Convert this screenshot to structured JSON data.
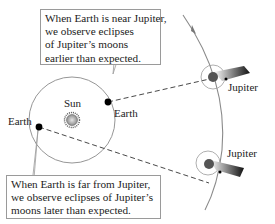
{
  "diagram": {
    "callouts": {
      "near": {
        "lines": [
          "When Earth is near Jupiter,",
          "we observe eclipses",
          "of Jupiter’s moons",
          "earlier than expected."
        ]
      },
      "far": {
        "lines": [
          "When Earth is far from Jupiter,",
          "we observe eclipses of Jupiter’s",
          "moons later than expected."
        ]
      }
    },
    "labels": {
      "sun": "Sun",
      "earth_near": "Earth",
      "earth_far": "Earth",
      "jupiter_top": "Jupiter",
      "jupiter_bottom": "Jupiter"
    },
    "colors": {
      "orbit": "#8a8a8a",
      "dashed_line": "#333333",
      "earth_dot": "#000000",
      "sun_fill": "#b0b0b0",
      "callout_border": "#9a9a9a"
    }
  }
}
